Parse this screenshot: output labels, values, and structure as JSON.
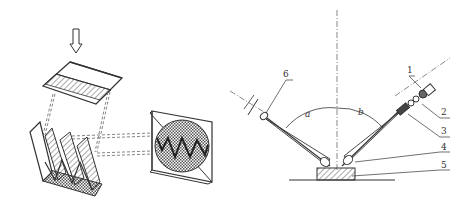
{
  "figure_left": {
    "description": "Light-section projection: slit light projected onto a ridged surface, profile image shown on screen",
    "elements": [
      "incident-light-arrow",
      "slit-plate",
      "ridged-surface",
      "projection-lines",
      "viewing-screen",
      "profile-waveform"
    ]
  },
  "figure_right": {
    "description": "Light-section microscope optical schematic",
    "labels": [
      {
        "id": "1",
        "text": "1"
      },
      {
        "id": "2",
        "text": "2"
      },
      {
        "id": "3",
        "text": "3"
      },
      {
        "id": "4",
        "text": "4"
      },
      {
        "id": "5",
        "text": "5"
      },
      {
        "id": "6",
        "text": "6"
      }
    ],
    "angles": [
      {
        "id": "a",
        "text": "a"
      },
      {
        "id": "b",
        "text": "b"
      }
    ]
  },
  "colors": {
    "line": "#333333",
    "background": "#ffffff",
    "hatch": "#555555"
  }
}
